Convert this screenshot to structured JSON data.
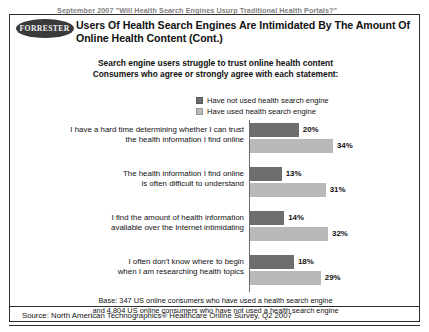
{
  "header": {
    "eyebrow": "September 2007 \"Will Health Search Engines Usurp Traditional Health Portals?\"",
    "logo_text": "FORRESTER",
    "title": "Users Of Health Search Engines Are Intimidated By The Amount Of Online Health Content (Cont.)"
  },
  "subhead": {
    "line1": "Search engine users struggle to trust online health content",
    "line2": "Consumers who agree or strongly agree with each statement:"
  },
  "legend": {
    "items": [
      {
        "label": "Have not used health search engine",
        "color": "#6e6e6e"
      },
      {
        "label": "Have used health search engine",
        "color": "#b9b9b9"
      }
    ]
  },
  "footer": {
    "base_line1": "Base: 347 US online consumers who have used a health search engine",
    "base_line2": "and 4,804 US online consumers who have not used a health search engine",
    "source": "Source: North American Technographics® Healthcare Online Survey, Q2 2007"
  },
  "chart_data": {
    "type": "bar",
    "orientation": "horizontal",
    "title": "Search engine users struggle to trust online health content",
    "subtitle": "Consumers who agree or strongly agree with each statement:",
    "xlabel": "",
    "ylabel": "",
    "xlim": [
      0,
      40
    ],
    "grid": false,
    "legend_position": "top-center",
    "value_suffix": "%",
    "categories": [
      "I have a hard time determining whether I can trust the health information I find online",
      "The health information I find online is often difficult to understand",
      "I find the amount of health information available over the Internet intimidating",
      "I often don't know where to begin when I am researching health topics"
    ],
    "category_lines": [
      [
        "I have a hard time determining whether I can trust",
        "the health information I find online"
      ],
      [
        "The health information I find online",
        "is often difficult to understand"
      ],
      [
        "I find the amount of health information",
        "available over the Internet intimidating"
      ],
      [
        "I often don't know where to begin",
        "when I am researching health topics"
      ]
    ],
    "series": [
      {
        "name": "Have not used health search engine",
        "color": "#6e6e6e",
        "values": [
          20,
          13,
          14,
          18
        ],
        "labels": [
          "20%",
          "13%",
          "14%",
          "18%"
        ]
      },
      {
        "name": "Have used health search engine",
        "color": "#b9b9b9",
        "values": [
          34,
          31,
          32,
          29
        ],
        "labels": [
          "34%",
          "31%",
          "32%",
          "29%"
        ]
      }
    ]
  }
}
